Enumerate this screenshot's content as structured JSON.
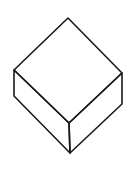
{
  "diagram": {
    "type": "isometric-box",
    "title": "",
    "stroke_color": "#1a1a1a",
    "background": "#ffffff",
    "vertices": {
      "top": [
        68,
        18
      ],
      "left": [
        14,
        70
      ],
      "right": [
        122,
        73
      ],
      "front_top": [
        69,
        123
      ],
      "left_bottom": [
        14,
        96
      ],
      "right_bottom": [
        122,
        104
      ],
      "front_bottom": [
        70,
        153
      ]
    },
    "faces": [
      {
        "name": "top-face",
        "points": "68,18 122,73 69,123 14,70"
      },
      {
        "name": "left-face",
        "points": "14,70 69,123 70,153 14,96"
      },
      {
        "name": "right-face",
        "points": "69,123 122,73 122,104 70,153"
      }
    ]
  }
}
